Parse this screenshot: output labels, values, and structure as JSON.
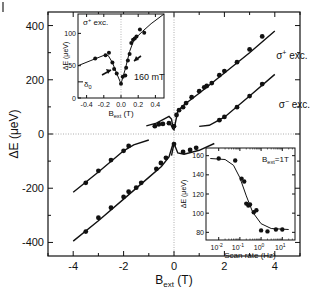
{
  "chart_data": [
    {
      "id": "main",
      "type": "scatter",
      "title": "",
      "xlabel": "B",
      "xlabel_sub": "ext",
      "xlabel_unit": " (T)",
      "ylabel": "ΔE (μeV)",
      "xlim": [
        -5,
        5
      ],
      "ylim": [
        -450,
        450
      ],
      "xticks": [
        -4,
        -2,
        0,
        2,
        4
      ],
      "xtick_labels": [
        "-4",
        "-2",
        "0",
        "2",
        "4"
      ],
      "yticks": [
        400,
        200,
        0,
        -200,
        -400
      ],
      "ytick_labels": [
        "400",
        "200",
        "0",
        "-200",
        "-400"
      ],
      "zero_lines": true,
      "annotations": [
        {
          "text": "σ",
          "sup": "+",
          "rest": " exc.",
          "x": 3.5,
          "y": 275
        },
        {
          "text": "σ",
          "sup": "−",
          "rest": " exc.",
          "x": 3.6,
          "y": 95
        }
      ],
      "series": [
        {
          "name": "σ+ exc. (upper, positive B)",
          "points": [
            [
              0.0,
              29
            ],
            [
              0.1,
              70
            ],
            [
              0.2,
              88
            ],
            [
              0.36,
              99
            ],
            [
              0.48,
              114
            ],
            [
              0.7,
              136
            ],
            [
              1.0,
              158
            ],
            [
              1.2,
              172
            ],
            [
              1.3,
              177
            ],
            [
              1.5,
              188
            ],
            [
              1.8,
              217
            ],
            [
              2.0,
              232
            ],
            [
              2.5,
              265
            ],
            [
              3.0,
              312
            ],
            [
              3.5,
              360
            ]
          ],
          "fit": [
            [
              -0.15,
              40
            ],
            [
              -0.05,
              20
            ],
            [
              0.0,
              15
            ],
            [
              0.05,
              40
            ],
            [
              0.15,
              85
            ],
            [
              0.4,
              108
            ],
            [
              1.0,
              150
            ],
            [
              2.0,
              225
            ],
            [
              3.0,
              300
            ],
            [
              4.0,
              380
            ]
          ]
        },
        {
          "name": "σ+ exc. (upper, negative B)",
          "points": [
            [
              -0.76,
              29
            ],
            [
              -0.6,
              36
            ],
            [
              -0.44,
              37
            ],
            [
              -0.2,
              40
            ]
          ],
          "fit": [
            [
              -1.1,
              30
            ],
            [
              -0.7,
              40
            ],
            [
              -0.4,
              55
            ],
            [
              -0.2,
              65
            ],
            [
              -0.1,
              55
            ],
            [
              -0.05,
              30
            ]
          ]
        },
        {
          "name": "σ− exc.",
          "points": [
            [
              1.8,
              51
            ],
            [
              2.0,
              63
            ],
            [
              2.5,
              99
            ],
            [
              3.0,
              140
            ],
            [
              3.5,
              184
            ]
          ],
          "fit": [
            [
              1.0,
              28
            ],
            [
              1.4,
              32
            ],
            [
              2.0,
              62
            ],
            [
              3.0,
              140
            ],
            [
              4.0,
              220
            ]
          ]
        },
        {
          "name": "lower branch (positive B)",
          "points": [
            [
              0.0,
              -37
            ],
            [
              0.36,
              -66
            ],
            [
              0.64,
              -59
            ],
            [
              0.88,
              -51
            ]
          ],
          "fit": [
            [
              -0.1,
              -80
            ],
            [
              0.0,
              -35
            ],
            [
              0.15,
              -70
            ],
            [
              0.4,
              -75
            ],
            [
              1.0,
              -60
            ],
            [
              1.6,
              -35
            ]
          ]
        },
        {
          "name": "lower branch upper line (negative B)",
          "points": [
            [
              -3.5,
              -180
            ],
            [
              -3.0,
              -136
            ],
            [
              -2.5,
              -96
            ],
            [
              -2.0,
              -62
            ],
            [
              -1.8,
              -44
            ]
          ],
          "fit": [
            [
              -4.0,
              -215
            ],
            [
              -3.0,
              -140
            ],
            [
              -2.0,
              -62
            ],
            [
              -1.6,
              -40
            ],
            [
              -1.0,
              -22
            ]
          ]
        },
        {
          "name": "lower branch lower line (negative B)",
          "points": [
            [
              -3.5,
              -360
            ],
            [
              -3.0,
              -309
            ],
            [
              -2.5,
              -272
            ],
            [
              -2.0,
              -232
            ],
            [
              -1.8,
              -213
            ],
            [
              -1.5,
              -198
            ],
            [
              -1.3,
              -180
            ],
            [
              -0.7,
              -129
            ],
            [
              -0.52,
              -107
            ],
            [
              -0.32,
              -88
            ]
          ],
          "fit": [
            [
              -4.0,
              -395
            ],
            [
              -3.0,
              -320
            ],
            [
              -2.0,
              -240
            ],
            [
              -1.0,
              -160
            ],
            [
              -0.5,
              -120
            ],
            [
              -0.2,
              -85
            ],
            [
              -0.05,
              -40
            ]
          ]
        }
      ]
    },
    {
      "id": "inset-field",
      "type": "scatter",
      "title": "",
      "annotation_top": {
        "text": "σ",
        "sup": "+",
        "rest": " exc."
      },
      "annotation_arrow": "160 mT",
      "annotation_delta": {
        "text": "δ",
        "sub": "0"
      },
      "xlabel": "B",
      "xlabel_sub": "ext",
      "xlabel_unit": " (T)",
      "ylabel": "ΔE (μeV)",
      "xlim": [
        -0.5,
        0.5
      ],
      "ylim": [
        0,
        130
      ],
      "xticks": [
        -0.4,
        -0.2,
        0.0,
        0.2,
        0.4
      ],
      "xtick_labels": [
        "-0.4",
        "-0.2",
        "0.0",
        "0.2",
        "0.4"
      ],
      "yticks": [
        0,
        50,
        100
      ],
      "ytick_labels": [
        "0",
        "50",
        "100"
      ],
      "delta0": 25,
      "points": [
        [
          -0.3,
          61
        ],
        [
          -0.18,
          66
        ],
        [
          -0.14,
          70
        ],
        [
          -0.1,
          55
        ],
        [
          -0.08,
          45
        ],
        [
          -0.05,
          38
        ],
        [
          0.0,
          22
        ],
        [
          0.02,
          33
        ],
        [
          0.05,
          35
        ],
        [
          0.06,
          47
        ],
        [
          0.08,
          58
        ],
        [
          0.1,
          68
        ],
        [
          0.12,
          85
        ],
        [
          0.14,
          90
        ],
        [
          0.16,
          92
        ],
        [
          0.18,
          95
        ],
        [
          0.22,
          106
        ],
        [
          0.27,
          101
        ]
      ],
      "fit": [
        [
          -0.5,
          50
        ],
        [
          -0.35,
          58
        ],
        [
          -0.2,
          66
        ],
        [
          -0.15,
          66
        ],
        [
          -0.1,
          55
        ],
        [
          -0.05,
          38
        ],
        [
          0.0,
          22
        ],
        [
          0.05,
          45
        ],
        [
          0.1,
          72
        ],
        [
          0.15,
          90
        ],
        [
          0.25,
          103
        ],
        [
          0.35,
          115
        ],
        [
          0.5,
          130
        ]
      ]
    },
    {
      "id": "inset-scan",
      "type": "scatter",
      "title": "",
      "annotation": {
        "text": "B",
        "sub": "ext",
        "rest": "=1T"
      },
      "xlabel": "Scan rate (Hz)",
      "ylabel": "ΔE (μeV)",
      "xscale": "log",
      "xlim_log10": [
        -2.6,
        1.6
      ],
      "ylim": [
        72,
        168
      ],
      "xticks_log10": [
        -2,
        -1,
        0,
        1
      ],
      "xtick_labels": [
        "10",
        "10",
        "10",
        "10"
      ],
      "xtick_exponents": [
        "-2",
        "-1",
        "0",
        "1"
      ],
      "yticks": [
        80,
        100,
        120,
        140,
        160
      ],
      "ytick_labels": [
        "80",
        "100",
        "120",
        "140",
        "160"
      ],
      "points": [
        [
          0.01,
          157
        ],
        [
          0.06,
          155
        ],
        [
          0.12,
          136
        ],
        [
          0.16,
          133
        ],
        [
          0.2,
          110
        ],
        [
          0.25,
          108
        ],
        [
          0.3,
          109
        ],
        [
          0.45,
          101
        ],
        [
          0.6,
          103
        ],
        [
          1.0,
          82
        ],
        [
          2.0,
          81
        ],
        [
          5.0,
          83
        ],
        [
          10.0,
          83
        ]
      ],
      "fit": [
        [
          0.004,
          157
        ],
        [
          0.02,
          156
        ],
        [
          0.05,
          150
        ],
        [
          0.1,
          137
        ],
        [
          0.2,
          118
        ],
        [
          0.4,
          101
        ],
        [
          1.0,
          89
        ],
        [
          3.0,
          84
        ],
        [
          20.0,
          83
        ]
      ]
    }
  ]
}
